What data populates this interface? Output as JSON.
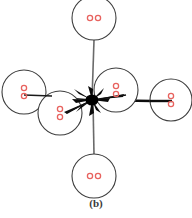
{
  "figure": {
    "caption": "(b)",
    "type": "schematic-diagram",
    "background_color": "#ffffff",
    "circle_stroke_color": "#3d3d3d",
    "line_color": "#5a5a5a",
    "junction_color": "#000000",
    "pair_color": "#e8635f",
    "caption_color": "#3a3a3a",
    "center": {
      "x": 92,
      "y": 100
    },
    "nodes": [
      {
        "id": "node-top",
        "label": "top",
        "cx": 94,
        "cy": 18,
        "r": 22,
        "pair_layout": "horizontal",
        "pair_count": 2
      },
      {
        "id": "node-left-outer",
        "label": "left-outer",
        "cx": 24,
        "cy": 92,
        "r": 22,
        "pair_layout": "vertical",
        "pair_count": 2
      },
      {
        "id": "node-left-inner",
        "label": "left-inner",
        "cx": 60,
        "cy": 113,
        "r": 22,
        "pair_layout": "vertical",
        "pair_count": 2
      },
      {
        "id": "node-right-inner",
        "label": "right-inner",
        "cx": 116,
        "cy": 90,
        "r": 22,
        "pair_layout": "vertical",
        "pair_count": 2
      },
      {
        "id": "node-right-outer",
        "label": "right-outer",
        "cx": 171,
        "cy": 100,
        "r": 21,
        "pair_layout": "vertical",
        "pair_count": 2
      },
      {
        "id": "node-bottom",
        "label": "bottom",
        "cx": 94,
        "cy": 176,
        "r": 22,
        "pair_layout": "horizontal",
        "pair_count": 2
      }
    ],
    "connectors": [
      {
        "id": "connector-top",
        "from": "node-top",
        "to": "center",
        "style": "thin"
      },
      {
        "id": "connector-bottom",
        "from": "node-bottom",
        "to": "center",
        "style": "thin"
      },
      {
        "id": "connector-left-outer",
        "from": "node-left-outer",
        "to": "center",
        "style": "thin"
      },
      {
        "id": "connector-left-inner",
        "from": "node-left-inner",
        "to": "center",
        "style": "thick"
      },
      {
        "id": "connector-right-inner",
        "from": "node-right-inner",
        "to": "center",
        "style": "thick"
      },
      {
        "id": "connector-right-outer",
        "from": "node-right-outer",
        "to": "center",
        "style": "thick"
      }
    ]
  }
}
